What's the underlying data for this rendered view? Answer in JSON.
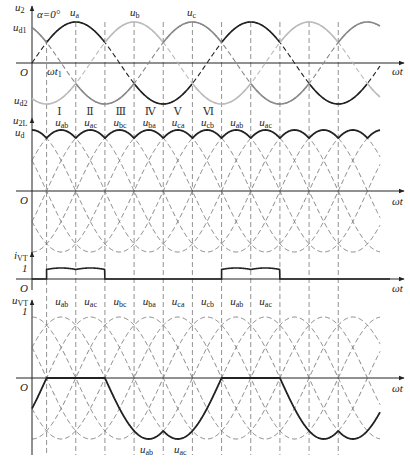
{
  "figure": {
    "alpha_label": "α=0°",
    "origin_label": "O",
    "x_axis_label": "ωt",
    "wt1_label": "ωt",
    "wt1_sub": "1"
  },
  "panels": [
    {
      "id": "phase-voltages",
      "y_label": "u",
      "y_sub": "2",
      "upper_label": "u",
      "upper_sub": "d1",
      "lower_label": "u",
      "lower_sub": "d2",
      "series": [
        {
          "name": "u",
          "sub": "a",
          "phase_deg": 0,
          "color": "#222222"
        },
        {
          "name": "u",
          "sub": "b",
          "phase_deg": -120,
          "color": "#bbbbbb"
        },
        {
          "name": "u",
          "sub": "c",
          "phase_deg": 120,
          "color": "#888888"
        }
      ]
    },
    {
      "id": "output-voltage",
      "y_label": "u",
      "y_sub": "2L",
      "upper_label": "u",
      "upper_sub": "d",
      "intervals": [
        {
          "roman": "Ⅰ",
          "name": "u",
          "sub": "ab"
        },
        {
          "roman": "Ⅱ",
          "name": "u",
          "sub": "ac"
        },
        {
          "roman": "Ⅲ",
          "name": "u",
          "sub": "bc"
        },
        {
          "roman": "Ⅳ",
          "name": "u",
          "sub": "ba"
        },
        {
          "roman": "Ⅴ",
          "name": "u",
          "sub": "ca"
        },
        {
          "roman": "Ⅵ",
          "name": "u",
          "sub": "cb"
        },
        {
          "roman": "",
          "name": "u",
          "sub": "ab"
        },
        {
          "roman": "",
          "name": "u",
          "sub": "ac"
        }
      ]
    },
    {
      "id": "thyristor-current",
      "y_label": "i",
      "y_sub": "VT",
      "level_label": "1"
    },
    {
      "id": "thyristor-voltage",
      "y_label": "u",
      "y_sub": "VT",
      "level_label": "1",
      "intervals": [
        {
          "name": "u",
          "sub": "ab"
        },
        {
          "name": "u",
          "sub": "ac"
        },
        {
          "name": "u",
          "sub": "bc"
        },
        {
          "name": "u",
          "sub": "ba"
        },
        {
          "name": "u",
          "sub": "ca"
        },
        {
          "name": "u",
          "sub": "cb"
        },
        {
          "name": "u",
          "sub": "ab"
        },
        {
          "name": "u",
          "sub": "ac"
        }
      ],
      "bottom_labels": [
        {
          "name": "u",
          "sub": "ab"
        },
        {
          "name": "u",
          "sub": "ac"
        }
      ]
    }
  ],
  "geometry": {
    "x0": 32,
    "period_px": 175,
    "x_end": 380,
    "p1_zero": 63,
    "p1_amp": 41,
    "p2_zero": 191,
    "p2_amp": 61,
    "p3_zero": 279,
    "p3_level": 11,
    "p4_zero": 378,
    "p4_amp": 61
  }
}
